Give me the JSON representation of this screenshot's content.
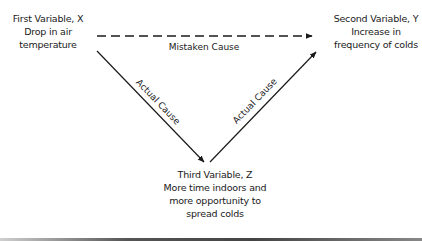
{
  "diagram": {
    "nodes": {
      "x": {
        "title": "First Variable, X",
        "description": "Drop in air\ntemperature"
      },
      "y": {
        "title": "Second Variable, Y",
        "description": "Increase in\nfrequency of colds"
      },
      "z": {
        "title": "Third Variable, Z",
        "description": "More time indoors and\nmore opportunity to\nspread colds"
      }
    },
    "edges": [
      {
        "from": "x",
        "to": "y",
        "label": "Mistaken Cause",
        "style": "dashed"
      },
      {
        "from": "x",
        "to": "z",
        "label": "Actual Cause",
        "style": "solid"
      },
      {
        "from": "z",
        "to": "y",
        "label": "Actual Cause",
        "style": "solid"
      }
    ],
    "colors": {
      "line": "#1a1a1a",
      "background": "#ffffff"
    }
  }
}
